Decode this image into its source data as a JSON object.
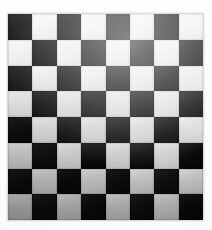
{
  "image": {
    "subject": "checkerboard",
    "description": "8x8 black and white checkerboard photograph",
    "background_color": "#ffffff",
    "width": 212,
    "height": 230
  },
  "board": {
    "label": "checkerboard",
    "rows": 8,
    "columns": 8,
    "total_squares": 64,
    "origin_x": 8,
    "origin_y": 14,
    "width": 195,
    "height": 206,
    "square_width": 24.4,
    "square_height": 25.7,
    "top_left_square_color": "dark",
    "dark_color": "#0a0a0a",
    "light_color": "#e8e8e8",
    "grid_line_color": "#2a2a2a",
    "pattern": [
      [
        "dark",
        "light",
        "dark",
        "light",
        "dark",
        "light",
        "dark",
        "light"
      ],
      [
        "light",
        "dark",
        "light",
        "dark",
        "light",
        "dark",
        "light",
        "dark"
      ],
      [
        "dark",
        "light",
        "dark",
        "light",
        "dark",
        "light",
        "dark",
        "light"
      ],
      [
        "light",
        "dark",
        "light",
        "dark",
        "light",
        "dark",
        "light",
        "dark"
      ],
      [
        "dark",
        "light",
        "dark",
        "light",
        "dark",
        "light",
        "dark",
        "light"
      ],
      [
        "light",
        "dark",
        "light",
        "dark",
        "light",
        "dark",
        "light",
        "dark"
      ],
      [
        "dark",
        "light",
        "dark",
        "light",
        "dark",
        "light",
        "dark",
        "light"
      ],
      [
        "light",
        "dark",
        "light",
        "dark",
        "light",
        "dark",
        "light",
        "dark"
      ]
    ]
  },
  "lighting": {
    "description": "uneven scan illumination, brightest upper-right, darkest lower-left",
    "highlight_position": "62% 14%",
    "light_square_brightness_by_row": [
      "#f6f6f6",
      "#f2f2f2",
      "#ececec",
      "#e3e3e3",
      "#dcdcdc",
      "#d6d6d6",
      "#cfcfcf",
      "#c9c9c9"
    ]
  }
}
